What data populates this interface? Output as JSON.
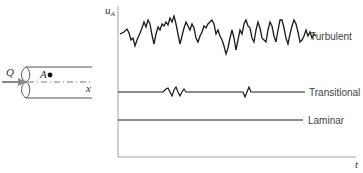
{
  "pipe": {
    "flow_label": "Q",
    "point_label": "A",
    "axis_label": "x"
  },
  "plot": {
    "y_axis_label": "u",
    "y_axis_subscript": "A",
    "x_axis_label": "t",
    "series": [
      {
        "name": "Turbulent",
        "label": "Turbulent"
      },
      {
        "name": "Transitional",
        "label": "Transitional"
      },
      {
        "name": "Laminar",
        "label": "Laminar"
      }
    ]
  },
  "colors": {
    "line": "#222222",
    "axis": "#999999",
    "text": "#444444"
  }
}
